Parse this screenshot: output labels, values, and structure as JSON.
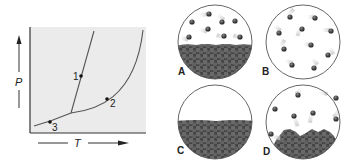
{
  "phase_diagram": {
    "x_axis_label": "T",
    "y_axis_label": "P",
    "points": [
      {
        "label": "1",
        "x": 81,
        "y": 76,
        "label_x": 73,
        "label_y": 80
      },
      {
        "label": "2",
        "x": 107,
        "y": 99,
        "label_x": 110,
        "label_y": 107
      },
      {
        "label": "3",
        "x": 50,
        "y": 122,
        "label_x": 52,
        "label_y": 131
      }
    ],
    "colors": {
      "background": "#ebebeb",
      "axis": "#333333",
      "curve": "#555555"
    }
  },
  "panels": [
    {
      "label": "A",
      "description": "liquid with vapor above"
    },
    {
      "label": "B",
      "description": "gas only"
    },
    {
      "label": "C",
      "description": "liquid only"
    },
    {
      "label": "D",
      "description": "solid with vapor above"
    }
  ],
  "colors": {
    "molecule": "#4a4a4a",
    "condensed": "#474747",
    "condensed_highlight": "#6b6b6b",
    "circle_outline": "#555555"
  }
}
